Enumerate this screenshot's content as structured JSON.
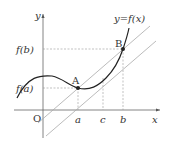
{
  "diagram": {
    "curve_label": "y=f(x)",
    "axes": {
      "x_label": "x",
      "y_label": "y",
      "origin_label": "O"
    },
    "points": [
      {
        "name": "A",
        "x_label": "a",
        "y_label": "f(a)"
      },
      {
        "name": "B",
        "x_label": "b",
        "y_label": "f(b)"
      }
    ],
    "extra_x_label": "c",
    "colors": {
      "curve": "#222222",
      "lines": "#999999",
      "dashed": "#888888",
      "axes": "#555555"
    }
  }
}
